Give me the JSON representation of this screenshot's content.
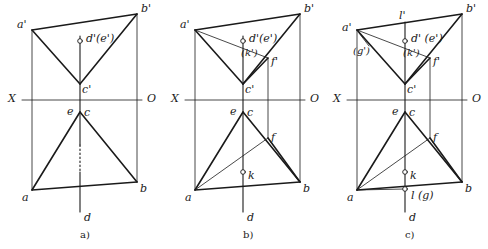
{
  "page": {
    "kind": "descriptive-geometry-projection-figures",
    "width": 488,
    "height": 249,
    "background": "#ffffff",
    "ink": "#1a1a1a"
  },
  "figures": [
    {
      "id": "a",
      "caption": "a)",
      "axis": {
        "left_label": "X",
        "right_label": "O"
      },
      "labels": {
        "a_prime": "a'",
        "b_prime": "b'",
        "c_prime": "c'",
        "d_e_prime": "d'(e')",
        "e": "e",
        "c": "c",
        "a": "a",
        "b": "b",
        "d": "d"
      }
    },
    {
      "id": "b",
      "caption": "b)",
      "axis": {
        "left_label": "X",
        "right_label": "O"
      },
      "labels": {
        "a_prime": "a'",
        "b_prime": "b'",
        "c_prime": "c'",
        "d_e_prime": "d'(e')",
        "k_prime": "(k')",
        "f_prime": "f'",
        "e": "e",
        "c": "c",
        "f": "f",
        "k": "k",
        "a": "a",
        "b": "b",
        "d": "d"
      }
    },
    {
      "id": "c",
      "caption": "c)",
      "axis": {
        "left_label": "X",
        "right_label": "O"
      },
      "labels": {
        "l_prime": "l'",
        "a_prime": "a'",
        "b_prime": "b'",
        "c_prime": "c'",
        "d_e_prime": "d' (e')",
        "g_prime": "(g')",
        "k_prime": "(k')",
        "f_prime": "f'",
        "e": "e",
        "c": "c",
        "f": "f",
        "k": "k",
        "a": "a",
        "b": "b",
        "l_g": "l (g)",
        "d": "d"
      }
    }
  ]
}
